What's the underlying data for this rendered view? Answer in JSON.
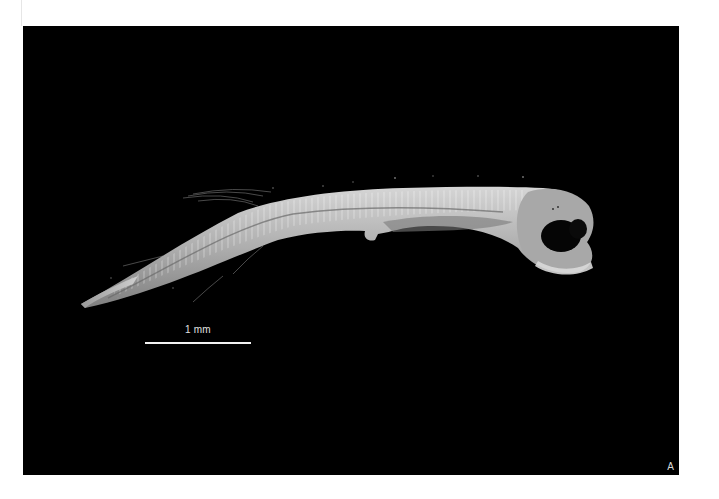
{
  "figure": {
    "panel_label": "A",
    "background_color": "#000000",
    "page_color": "#ffffff",
    "scale_bar": {
      "label": "1 mm",
      "color": "#f2f2f2"
    }
  }
}
